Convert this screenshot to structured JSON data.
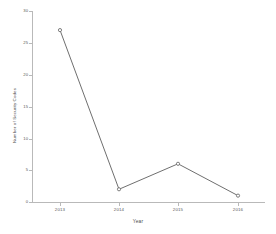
{
  "chart_data": {
    "type": "line",
    "title": "",
    "subtitle": "",
    "xlabel": "Year",
    "ylabel": "Number of Security Codes",
    "categories": [
      "2013",
      "2014",
      "2015",
      "2016"
    ],
    "x": [
      2013,
      2014,
      2015,
      2016
    ],
    "values": [
      27,
      2,
      6,
      1
    ],
    "series": [
      {
        "name": "Number of Security Codes",
        "values": [
          27,
          2,
          6,
          1
        ]
      }
    ],
    "ylim": [
      0,
      30
    ],
    "xlim": [
      2012.6,
      2016.6
    ],
    "yticks": [
      0,
      5,
      10,
      15,
      20,
      25,
      30
    ],
    "ytick_labels": [
      "0",
      "5",
      "10",
      "15",
      "20",
      "25",
      "30"
    ],
    "xticks": [
      2013,
      2014,
      2015,
      2016
    ],
    "xtick_labels": [
      "2013",
      "2014",
      "2015",
      "2016"
    ],
    "grid": false,
    "legend": false,
    "legend_position": "none",
    "marker": "circle-open",
    "line_color": "#6f6f6f",
    "marker_color": "#6f6f6f",
    "axis_color": "#b9b9b9",
    "text_color": "#5a5a5a",
    "background": "#ffffff",
    "annotations": []
  },
  "axes": {
    "y_tick_0": "0",
    "y_tick_1": "5",
    "y_tick_2": "10",
    "y_tick_3": "15",
    "y_tick_4": "20",
    "y_tick_5": "25",
    "y_tick_6": "30",
    "x_tick_0": "2013",
    "x_tick_1": "2014",
    "x_tick_2": "2015",
    "x_tick_3": "2016"
  }
}
